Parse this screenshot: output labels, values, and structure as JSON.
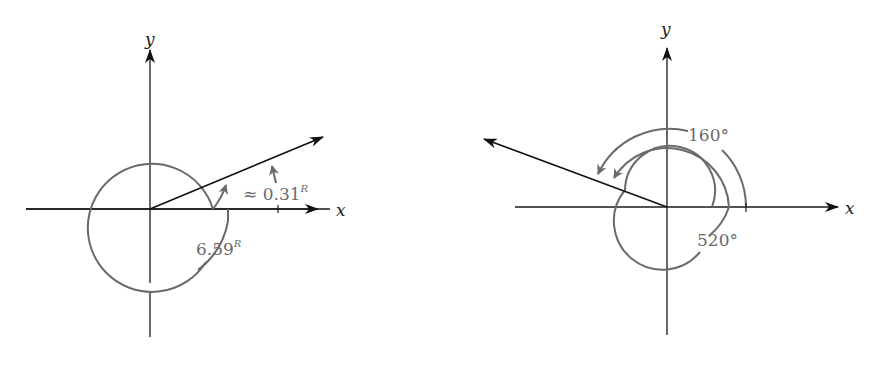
{
  "diagrams": [
    {
      "id": "left",
      "axes": {
        "x_label": "x",
        "y_label": "y"
      },
      "angle_labels": {
        "small": {
          "prefix": "≈ ",
          "value": "0.31",
          "unit": "R"
        },
        "large": {
          "value": "6.59",
          "unit": "R"
        }
      }
    },
    {
      "id": "right",
      "axes": {
        "x_label": "x",
        "y_label": "y"
      },
      "angle_labels": {
        "small": {
          "value": "160°"
        },
        "large": {
          "value": "520°"
        }
      }
    }
  ],
  "colors": {
    "axis": "#1a1a1a",
    "arc": "#6a6a6a",
    "ray": "#111111"
  }
}
